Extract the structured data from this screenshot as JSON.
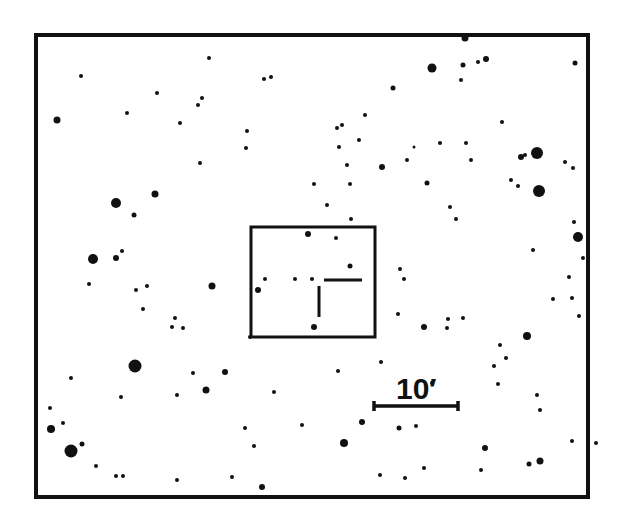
{
  "chart": {
    "type": "finding-chart",
    "colors": {
      "ink": "#111111",
      "background": "#ffffff"
    },
    "frame": {
      "x": 36,
      "y": 35,
      "w": 552,
      "h": 462,
      "stroke": 4
    },
    "field_box": {
      "x": 251,
      "y": 227,
      "w": 124,
      "h": 110,
      "stroke": 3
    },
    "marker": {
      "horizontal": {
        "x1": 324,
        "y1": 280,
        "x2": 362,
        "y2": 280
      },
      "vertical": {
        "x1": 319,
        "y1": 286,
        "x2": 319,
        "y2": 317
      }
    },
    "scale_bar": {
      "x1": 374,
      "y1": 406,
      "x2": 458,
      "y2": 406,
      "label": "10′",
      "label_x": 396,
      "label_y": 374
    },
    "stars": [
      [
        465,
        38,
        3.5
      ],
      [
        432,
        68,
        4.5
      ],
      [
        463,
        65,
        2.5
      ],
      [
        478,
        62,
        2
      ],
      [
        486,
        59,
        3
      ],
      [
        575,
        63,
        2.5
      ],
      [
        461,
        80,
        2
      ],
      [
        57,
        120,
        3.5
      ],
      [
        81,
        76,
        2
      ],
      [
        157,
        93,
        2
      ],
      [
        209,
        58,
        2
      ],
      [
        264,
        79,
        2
      ],
      [
        271,
        77,
        2
      ],
      [
        127,
        113,
        2
      ],
      [
        198,
        105,
        2
      ],
      [
        180,
        123,
        2
      ],
      [
        247,
        131,
        2
      ],
      [
        200,
        163,
        2
      ],
      [
        246,
        148,
        2
      ],
      [
        202,
        98,
        2
      ],
      [
        134,
        215,
        2.5
      ],
      [
        155,
        194,
        3.5
      ],
      [
        116,
        203,
        5
      ],
      [
        339,
        147,
        2
      ],
      [
        337,
        128,
        2
      ],
      [
        342,
        125,
        2
      ],
      [
        365,
        115,
        2
      ],
      [
        359,
        140,
        2
      ],
      [
        393,
        88,
        2.5
      ],
      [
        440,
        143,
        2
      ],
      [
        414,
        147,
        1.5
      ],
      [
        382,
        167,
        3
      ],
      [
        407,
        160,
        2
      ],
      [
        347,
        165,
        2
      ],
      [
        427,
        183,
        2.5
      ],
      [
        466,
        143,
        2
      ],
      [
        471,
        160,
        2
      ],
      [
        502,
        122,
        2
      ],
      [
        537,
        153,
        6
      ],
      [
        521,
        157,
        3
      ],
      [
        525,
        155,
        2
      ],
      [
        539,
        191,
        6
      ],
      [
        565,
        162,
        2
      ],
      [
        573,
        168,
        2
      ],
      [
        511,
        180,
        2
      ],
      [
        518,
        186,
        2
      ],
      [
        350,
        184,
        2
      ],
      [
        314,
        184,
        2
      ],
      [
        327,
        205,
        2
      ],
      [
        351,
        219,
        2
      ],
      [
        450,
        207,
        2
      ],
      [
        456,
        219,
        2
      ],
      [
        533,
        250,
        2
      ],
      [
        574,
        222,
        2
      ],
      [
        93,
        259,
        5
      ],
      [
        116,
        258,
        3
      ],
      [
        122,
        251,
        2
      ],
      [
        89,
        284,
        2
      ],
      [
        136,
        290,
        2
      ],
      [
        147,
        286,
        2
      ],
      [
        143,
        309,
        2
      ],
      [
        212,
        286,
        3.5
      ],
      [
        175,
        318,
        2
      ],
      [
        172,
        327,
        2
      ],
      [
        183,
        328,
        2
      ],
      [
        250,
        337,
        2
      ],
      [
        308,
        234,
        3
      ],
      [
        336,
        238,
        2
      ],
      [
        350,
        266,
        2.5
      ],
      [
        265,
        279,
        2
      ],
      [
        295,
        279,
        2
      ],
      [
        312,
        279,
        2
      ],
      [
        258,
        290,
        3
      ],
      [
        314,
        327,
        3
      ],
      [
        578,
        237,
        5
      ],
      [
        583,
        258,
        2
      ],
      [
        569,
        277,
        2
      ],
      [
        400,
        269,
        2
      ],
      [
        404,
        279,
        2
      ],
      [
        424,
        327,
        3
      ],
      [
        448,
        319,
        2
      ],
      [
        447,
        328,
        2
      ],
      [
        463,
        318,
        2
      ],
      [
        398,
        314,
        2
      ],
      [
        527,
        336,
        4
      ],
      [
        553,
        299,
        2
      ],
      [
        572,
        298,
        2
      ],
      [
        579,
        316,
        2
      ],
      [
        500,
        345,
        2
      ],
      [
        506,
        358,
        2
      ],
      [
        135,
        366,
        6.5
      ],
      [
        193,
        373,
        2
      ],
      [
        206,
        390,
        3.5
      ],
      [
        121,
        397,
        2
      ],
      [
        71,
        378,
        2
      ],
      [
        50,
        408,
        2
      ],
      [
        63,
        423,
        2
      ],
      [
        51,
        429,
        4
      ],
      [
        71,
        451,
        6.5
      ],
      [
        82,
        444,
        2.5
      ],
      [
        96,
        466,
        2
      ],
      [
        116,
        476,
        2
      ],
      [
        123,
        476,
        2
      ],
      [
        177,
        480,
        2
      ],
      [
        232,
        477,
        2
      ],
      [
        262,
        487,
        3
      ],
      [
        225,
        372,
        3
      ],
      [
        177,
        395,
        2
      ],
      [
        245,
        428,
        2
      ],
      [
        254,
        446,
        2
      ],
      [
        274,
        392,
        2
      ],
      [
        302,
        425,
        2
      ],
      [
        338,
        371,
        2
      ],
      [
        381,
        362,
        2
      ],
      [
        362,
        422,
        3
      ],
      [
        344,
        443,
        4
      ],
      [
        399,
        428,
        2.5
      ],
      [
        416,
        426,
        2
      ],
      [
        432,
        383,
        2
      ],
      [
        424,
        468,
        2
      ],
      [
        380,
        475,
        2
      ],
      [
        405,
        478,
        2
      ],
      [
        498,
        384,
        2
      ],
      [
        494,
        366,
        2
      ],
      [
        537,
        395,
        2
      ],
      [
        540,
        410,
        2
      ],
      [
        485,
        448,
        3
      ],
      [
        481,
        470,
        2
      ],
      [
        529,
        464,
        2.5
      ],
      [
        540,
        461,
        3.5
      ],
      [
        572,
        441,
        2
      ],
      [
        596,
        443,
        2
      ]
    ]
  }
}
